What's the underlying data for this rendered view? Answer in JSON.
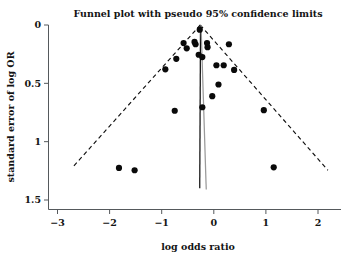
{
  "chart_data": {
    "type": "scatter",
    "title": "Funnel plot with pseudo 95% confidence limits",
    "xlabel": "log odds ratio",
    "ylabel": "standard error of log OR",
    "xlim": [
      -3.3,
      2.3
    ],
    "ylim": [
      1.5,
      0
    ],
    "y_inverted": true,
    "grid": false,
    "legend": null,
    "xticks": [
      -3,
      -2,
      -1,
      0,
      1,
      2
    ],
    "xticklabels": [
      "−3",
      "−2",
      "−1",
      "0",
      "1",
      "2"
    ],
    "yticks": [
      0,
      0.5,
      1,
      1.5
    ],
    "yticklabels": [
      "0",
      "0.5",
      "1",
      "1.5"
    ],
    "series": [
      {
        "name": "studies",
        "marker": "filled-circle",
        "color": "#0a0a0a",
        "points": [
          {
            "x": -0.27,
            "y": 0.04
          },
          {
            "x": -0.35,
            "y": 0.165
          },
          {
            "x": -0.37,
            "y": 0.145
          },
          {
            "x": -0.52,
            "y": 0.2
          },
          {
            "x": -0.58,
            "y": 0.155
          },
          {
            "x": -0.72,
            "y": 0.29
          },
          {
            "x": -0.93,
            "y": 0.38
          },
          {
            "x": -0.29,
            "y": 0.255
          },
          {
            "x": -0.22,
            "y": 0.275
          },
          {
            "x": -0.13,
            "y": 0.155
          },
          {
            "x": -0.12,
            "y": 0.19
          },
          {
            "x": 0.05,
            "y": 0.345
          },
          {
            "x": 0.19,
            "y": 0.345
          },
          {
            "x": 0.29,
            "y": 0.165
          },
          {
            "x": 0.39,
            "y": 0.385
          },
          {
            "x": 0.09,
            "y": 0.51
          },
          {
            "x": -0.03,
            "y": 0.61
          },
          {
            "x": -0.22,
            "y": 0.705
          },
          {
            "x": -0.75,
            "y": 0.735
          },
          {
            "x": 0.96,
            "y": 0.73
          },
          {
            "x": -1.82,
            "y": 1.225
          },
          {
            "x": -1.52,
            "y": 1.245
          },
          {
            "x": 1.15,
            "y": 1.22
          }
        ]
      }
    ],
    "confidence_limits": {
      "style": "dashed",
      "apex": {
        "x": -0.26,
        "y": 0.0
      },
      "left_end": {
        "x": -2.72,
        "y": 1.225
      },
      "right_end": {
        "x": 2.19,
        "y": 1.245
      },
      "label": "pseudo 95% confidence limits"
    },
    "reference_lines": [
      {
        "name": "pooled-effect-line",
        "color": "#101010",
        "x_top": -0.255,
        "x_bottom": -0.27,
        "y_top": 0.0,
        "y_bottom": 1.4
      },
      {
        "name": "secondary-line",
        "color": "#9a9a9a",
        "x_top": -0.245,
        "x_bottom": -0.145,
        "y_top": 0.0,
        "y_bottom": 1.41
      }
    ]
  }
}
